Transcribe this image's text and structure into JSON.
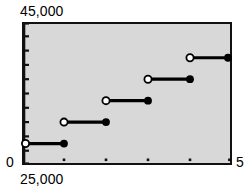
{
  "chart_data": {
    "type": "line",
    "title": "",
    "subtitle": "",
    "xlabel": "",
    "ylabel": "",
    "style": "step-function",
    "grid": false,
    "legend": null,
    "background_color": "#d8d8d8",
    "line_color": "#000000",
    "marker_filled_color": "#000000",
    "marker_open_fill": "#ffffff",
    "axis_labels": {
      "y_max": "45,000",
      "y_zero": "0",
      "y_min": "25,000",
      "x_max": "5"
    },
    "xlim": [
      0,
      5
    ],
    "ylim": [
      25000,
      45000
    ],
    "x_tick_values": [
      1,
      2,
      3,
      4,
      5
    ],
    "x_tick_labels": [
      "",
      "",
      "",
      "",
      ""
    ],
    "y_tick_count": 10,
    "series": [
      {
        "name": "step",
        "segments": [
          {
            "x_start": 0,
            "x_end": 1,
            "y": 28000,
            "left_marker": "open",
            "right_marker": "filled"
          },
          {
            "x_start": 1,
            "x_end": 2,
            "y": 31000,
            "left_marker": "open",
            "right_marker": "filled"
          },
          {
            "x_start": 2,
            "x_end": 3,
            "y": 34000,
            "left_marker": "open",
            "right_marker": "filled"
          },
          {
            "x_start": 3,
            "x_end": 4,
            "y": 37000,
            "left_marker": "open",
            "right_marker": "filled"
          },
          {
            "x_start": 4,
            "x_end": 5,
            "y": 40000,
            "left_marker": "open",
            "right_marker": "filled"
          }
        ]
      }
    ]
  }
}
